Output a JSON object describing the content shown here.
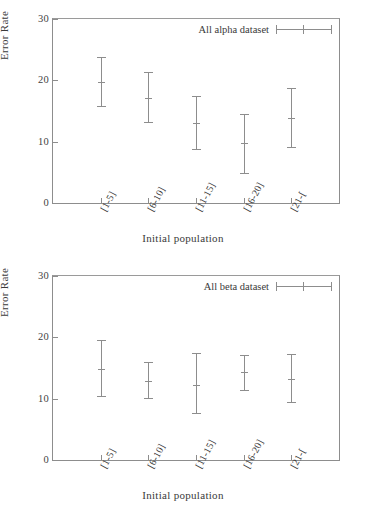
{
  "figure": {
    "panels": [
      "alpha",
      "beta"
    ]
  },
  "chart_data": [
    {
      "type": "scatter",
      "panel_id": "alpha",
      "title": "",
      "legend": "All alpha dataset",
      "legend_position": "top-right",
      "xlabel": "Initial population",
      "ylabel": "Error Rate",
      "categories": [
        "[1-5]",
        "[6-10]",
        "[11-15]",
        "[16-20]",
        "[21-["
      ],
      "values": [
        19.8,
        17.2,
        13.0,
        9.8,
        13.9
      ],
      "err_low": [
        15.6,
        13.0,
        8.7,
        4.8,
        8.9
      ],
      "err_high": [
        23.8,
        21.3,
        17.4,
        14.5,
        18.8
      ],
      "ylim": [
        0,
        30
      ],
      "yticks": [
        0,
        10,
        20,
        30
      ],
      "ytick_labels": [
        "0",
        "10",
        "20",
        "30"
      ],
      "grid": false
    },
    {
      "type": "scatter",
      "panel_id": "beta",
      "title": "",
      "legend": "All beta dataset",
      "legend_position": "top-right",
      "xlabel": "Initial population",
      "ylabel": "Error Rate",
      "categories": [
        "[1-5]",
        "[6-10]",
        "[11-15]",
        "[16-20]",
        "[21-["
      ],
      "values": [
        14.9,
        12.8,
        12.3,
        14.4,
        13.2
      ],
      "err_low": [
        10.3,
        9.9,
        7.5,
        11.3,
        9.3
      ],
      "err_high": [
        19.5,
        16.0,
        17.4,
        17.2,
        17.3
      ],
      "ylim": [
        0,
        30
      ],
      "yticks": [
        0,
        10,
        20,
        30
      ],
      "ytick_labels": [
        "0",
        "10",
        "20",
        "30"
      ],
      "grid": false
    }
  ],
  "colors": {
    "line": "#8d8d8d",
    "text": "#3a3a3a",
    "background": "#ffffff"
  }
}
